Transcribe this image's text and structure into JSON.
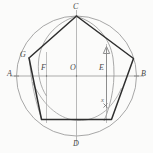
{
  "figure": {
    "type": "geometric-construction",
    "width": 153,
    "height": 153,
    "background_color": "#fbfbfa",
    "colors": {
      "pentagon_stroke": "#2b2b2b",
      "circle_stroke": "#9a9a9a",
      "construction_stroke": "#a8a8a8",
      "arc_stroke": "#9a9a9a",
      "arrow_stroke": "#8f8f8f",
      "label_color": "#4a4a4a"
    },
    "circle": {
      "center_x": 76.5,
      "center_y": 76.0,
      "radius": 60.0
    },
    "points": [
      {
        "id": "A",
        "label": "A",
        "x": 16.5,
        "y": 76.0,
        "label_x": 9,
        "label_y": 72,
        "role": "left-end-of-horizontal-diameter"
      },
      {
        "id": "B",
        "label": "B",
        "x": 136.5,
        "y": 76.0,
        "label_x": 141,
        "label_y": 72,
        "role": "right-end-of-horizontal-diameter"
      },
      {
        "id": "C",
        "label": "C",
        "x": 76.5,
        "y": 16.0,
        "label_x": 74,
        "label_y": 5,
        "role": "top-of-vertical-diameter-pentagon-apex"
      },
      {
        "id": "D",
        "label": "D",
        "x": 76.5,
        "y": 136.0,
        "label_x": 74,
        "label_y": 141,
        "role": "bottom-of-vertical-diameter"
      },
      {
        "id": "O",
        "label": "O",
        "x": 76.5,
        "y": 76.0,
        "label_x": 70,
        "label_y": 67,
        "role": "center"
      },
      {
        "id": "E",
        "label": "E",
        "x": 106.5,
        "y": 76.0,
        "label_x": 99,
        "label_y": 67,
        "role": "midpoint-of-OB"
      },
      {
        "id": "F",
        "label": "F",
        "x": 46.5,
        "y": 76.0,
        "label_x": 42,
        "label_y": 67,
        "role": "arc-intersection-left"
      },
      {
        "id": "G",
        "label": "G",
        "x": 29.0,
        "y": 58.0,
        "label_x": 21,
        "label_y": 54,
        "role": "pentagon-vertex-upper-left"
      },
      {
        "id": "x",
        "label": "x",
        "x": 106.5,
        "y": 106.0,
        "label_x": 103,
        "label_y": 103,
        "role": "arrow-tail-marker"
      }
    ],
    "pentagon": {
      "label": "inscribed regular pentagon",
      "vertices": [
        {
          "id": "C",
          "x": 76.5,
          "y": 16.0
        },
        {
          "id": "P2",
          "x": 133.5,
          "y": 58.5
        },
        {
          "id": "P3",
          "x": 111.5,
          "y": 119.5
        },
        {
          "id": "P4",
          "x": 41.5,
          "y": 119.5
        },
        {
          "id": "G",
          "x": 29.0,
          "y": 58.0
        }
      ]
    },
    "arrow": {
      "label": "measurement arrow x",
      "from_x": 106.5,
      "from_y": 108.0,
      "to_x": 106.5,
      "to_y": 48.0,
      "head": "up"
    },
    "construction_lines": [
      {
        "name": "horizontal-diameter-AB",
        "x1": 11,
        "y1": 76.0,
        "x2": 143,
        "y2": 76.0
      },
      {
        "name": "vertical-diameter-CD",
        "x1": 76.5,
        "y1": 11,
        "x2": 76.5,
        "y2": 143
      },
      {
        "name": "vertical-through-F",
        "x1": 46.5,
        "y1": 54,
        "x2": 46.5,
        "y2": 122
      },
      {
        "name": "vertical-through-E",
        "x1": 106.5,
        "y1": 46,
        "x2": 106.5,
        "y2": 122
      }
    ],
    "arcs": [
      {
        "name": "arc-from-C-through-G-to-F",
        "d": "M 76.5 16.5 A 62 62 0 0 0 40.5 82.5"
      },
      {
        "name": "arc-from-C-to-right-vertex",
        "d": "M 76.5 17 A 58 58 0 0 1 101.5 122"
      },
      {
        "name": "arc-E-radius-left",
        "d": "M 29 58 A 62 62 0 0 0 46.5 120"
      },
      {
        "name": "arc-lower-band",
        "d": "M 32 92 A 50 50 0 0 0 120 92"
      }
    ]
  }
}
